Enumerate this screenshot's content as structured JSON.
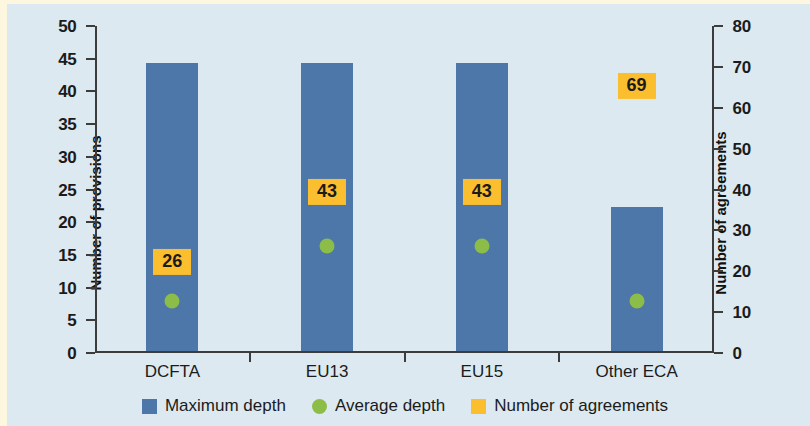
{
  "chart_data": {
    "type": "bar",
    "title": "",
    "subtitle": "",
    "categories": [
      "DCFTA",
      "EU13",
      "EU15",
      "Other ECA"
    ],
    "series": [
      {
        "name": "Maximum depth",
        "type": "bar",
        "axis": "left",
        "color": "#4d76a9",
        "values": [
          44,
          44,
          44,
          22
        ]
      },
      {
        "name": "Average depth",
        "type": "scatter",
        "axis": "left",
        "color": "#8cbd48",
        "values": [
          9,
          17.5,
          17.5,
          9
        ]
      },
      {
        "name": "Number of agreements",
        "type": "label",
        "axis": "right",
        "color": "#fbbe2e",
        "values": [
          26,
          43,
          43,
          69
        ]
      }
    ],
    "xlabel": "",
    "ylabel": "Number of provisions",
    "ylabel_right": "Number of agreements",
    "ylim": [
      0,
      50
    ],
    "ylim_right": [
      0,
      80
    ],
    "yticks": [
      0,
      5,
      10,
      15,
      20,
      25,
      30,
      35,
      40,
      45,
      50
    ],
    "yticks_right": [
      0,
      10,
      20,
      30,
      40,
      50,
      60,
      70,
      80
    ],
    "grid": false,
    "legend_position": "bottom",
    "background_color": "#dce9f1"
  },
  "axes": {
    "left": {
      "title": "Number of provisions",
      "ticks": [
        "0",
        "5",
        "10",
        "15",
        "20",
        "25",
        "30",
        "35",
        "40",
        "45",
        "50"
      ]
    },
    "right": {
      "title": "Number of agreements",
      "ticks": [
        "0",
        "10",
        "20",
        "30",
        "40",
        "50",
        "60",
        "70",
        "80"
      ]
    },
    "x": {
      "labels": [
        "DCFTA",
        "EU13",
        "EU15",
        "Other ECA"
      ]
    }
  },
  "data_labels": {
    "agreements": [
      "26",
      "43",
      "43",
      "69"
    ]
  },
  "legend": {
    "items": [
      {
        "label": "Maximum depth",
        "marker": "square-icon",
        "color": "#4d76a9"
      },
      {
        "label": "Average depth",
        "marker": "circle-icon",
        "color": "#8cbd48"
      },
      {
        "label": "Number of agreements",
        "marker": "square-icon",
        "color": "#fbbe2e"
      }
    ]
  }
}
